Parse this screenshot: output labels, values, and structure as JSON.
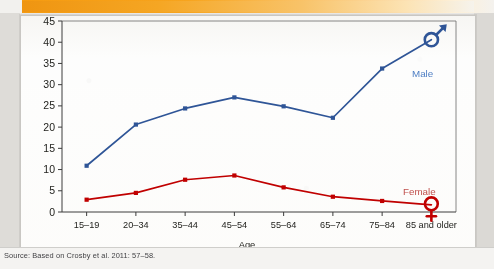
{
  "figure": {
    "source_note": "Source: Based on Crosby et al. 2011: 57–58.",
    "x_axis_title": "Age",
    "y_axis_title": ""
  },
  "legend": {
    "male_label": "Male",
    "female_label": "Female",
    "male_symbol": "mars-symbol",
    "female_symbol": "venus-symbol"
  },
  "colors": {
    "male": "#2f5597",
    "male_label": "#4f7fc4",
    "female": "#c00000",
    "female_label": "#c0504d",
    "axis": "#3c3c3c",
    "band_orange": "#f5a623",
    "card": "#fdfdfc"
  },
  "chart_data": {
    "type": "line",
    "title": "",
    "xlabel": "Age",
    "ylabel": "",
    "categories": [
      "15–19",
      "20–34",
      "35–44",
      "45–54",
      "55–64",
      "65–74",
      "75–84",
      "85 and older"
    ],
    "yticks": [
      0,
      5,
      10,
      15,
      20,
      25,
      30,
      35,
      40,
      45
    ],
    "ylim": [
      0,
      45
    ],
    "grid": false,
    "legend_position": "inline-right",
    "series": [
      {
        "name": "Male",
        "color": "#2f5597",
        "marker": "square",
        "end_marker": "mars-symbol",
        "values": [
          10.9,
          20.6,
          24.4,
          27.0,
          24.9,
          22.2,
          33.8,
          40.6
        ]
      },
      {
        "name": "Female",
        "color": "#c00000",
        "marker": "square",
        "end_marker": "venus-symbol",
        "values": [
          2.9,
          4.5,
          7.6,
          8.6,
          5.8,
          3.6,
          2.6,
          1.7
        ]
      }
    ]
  }
}
